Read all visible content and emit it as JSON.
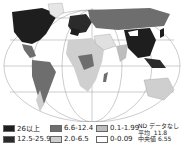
{
  "map": {
    "type": "world choropleth",
    "projection": "oval / pseudo-cylindrical with graticule"
  },
  "legend": {
    "items": [
      {
        "label": "26以上",
        "color": "#1e1e1e"
      },
      {
        "label": "12.5-25.9",
        "color": "#2b2b2b"
      },
      {
        "label": "6.6-12.4",
        "color": "#6e6e6e"
      },
      {
        "label": "2.0-6.5",
        "color": "#cfcfcf"
      },
      {
        "label": "0.1-1.99",
        "color": "#bdbdbd"
      },
      {
        "label": "0-0.09",
        "color": "#ffffff"
      }
    ],
    "nd_label": "ND データなし",
    "mean_label": "平均",
    "mean_value": "11.8",
    "median_label": "中央値",
    "median_value": "6.55"
  }
}
